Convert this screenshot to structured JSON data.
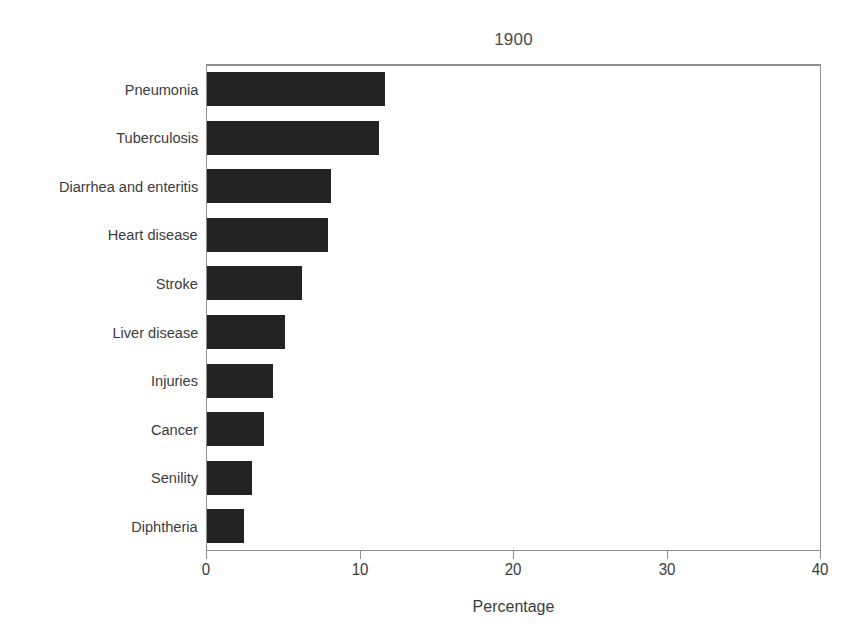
{
  "chart_data": {
    "type": "bar",
    "orientation": "horizontal",
    "title": "1900",
    "xlabel": "Percentage",
    "ylabel": "",
    "xlim": [
      0,
      40
    ],
    "xticks": [
      0,
      10,
      20,
      30,
      40
    ],
    "xtick_labels": [
      "0",
      "10",
      "20",
      "30",
      "40"
    ],
    "grid": false,
    "legend": false,
    "bar_color": "#232323",
    "axis_color": "#8e8e8e",
    "text_color": "#3b3b3b",
    "categories": [
      "Pneumonia",
      "Tuberculosis",
      "Diarrhea and enteritis",
      "Heart disease",
      "Stroke",
      "Liver disease",
      "Injuries",
      "Cancer",
      "Senility",
      "Diphtheria"
    ],
    "values": [
      11.6,
      11.2,
      8.1,
      7.9,
      6.2,
      5.1,
      4.3,
      3.7,
      2.9,
      2.4
    ]
  }
}
